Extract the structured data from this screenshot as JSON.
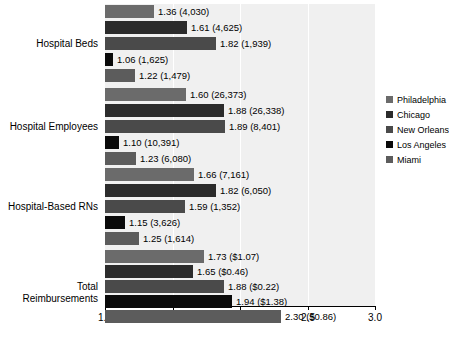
{
  "chart_data": {
    "type": "bar",
    "orientation": "horizontal",
    "title": "",
    "subtitle": "",
    "xlabel": "",
    "ylabel": "",
    "xlim": [
      1.0,
      3.0
    ],
    "xticks": [
      "1.0",
      "1.5",
      "2.0",
      "2.5",
      "3.0"
    ],
    "xtick_values": [
      1.0,
      1.5,
      2.0,
      2.5,
      3.0
    ],
    "gridlines": [
      1.5,
      2.0,
      2.5
    ],
    "grid": true,
    "legend_position": "right",
    "categories": [
      "Hospital Beds",
      "Hospital Employees",
      "Hospital-Based RNs",
      "Total Reimbursements"
    ],
    "series": [
      {
        "name": "Philadelphia",
        "color": "#6b6b6b",
        "values": [
          1.36,
          1.6,
          1.66,
          1.73
        ],
        "labels": [
          "1.36 (4,030)",
          "1.60 (26,373)",
          "1.66 (7,161)",
          "1.73 ($1.07)"
        ]
      },
      {
        "name": "Chicago",
        "color": "#2b2b2b",
        "values": [
          1.61,
          1.88,
          1.82,
          1.65
        ],
        "labels": [
          "1.61 (4,625)",
          "1.88 (26,338)",
          "1.82 (6,050)",
          "1.65 ($0.46)"
        ]
      },
      {
        "name": "New Orleans",
        "color": "#4a4a4a",
        "values": [
          1.82,
          1.89,
          1.59,
          1.88
        ],
        "labels": [
          "1.82 (1,939)",
          "1.89 (8,401)",
          "1.59 (1,352)",
          "1.88 ($0.22)"
        ]
      },
      {
        "name": "Los Angeles",
        "color": "#0a0a0a",
        "values": [
          1.06,
          1.1,
          1.15,
          1.94
        ],
        "labels": [
          "1.06 (1,625)",
          "1.10 (10,391)",
          "1.15 (3,626)",
          "1.94 ($1.38)"
        ]
      },
      {
        "name": "Miami",
        "color": "#5c5c5c",
        "values": [
          1.22,
          1.23,
          1.25,
          2.3
        ],
        "labels": [
          "1.22 (1,479)",
          "1.23 (6,080)",
          "1.25 (1,614)",
          "2.30 ($0.86)"
        ]
      }
    ],
    "plot_background": "#f0f0f0",
    "axis_color": "#000000"
  },
  "legend": {
    "items": [
      {
        "label": "Philadelphia",
        "color": "#6b6b6b"
      },
      {
        "label": "Chicago",
        "color": "#2b2b2b"
      },
      {
        "label": "New Orleans",
        "color": "#4a4a4a"
      },
      {
        "label": "Los Angeles",
        "color": "#0a0a0a"
      },
      {
        "label": "Miami",
        "color": "#5c5c5c"
      }
    ]
  },
  "axis": {
    "ticks": [
      "1.0",
      "1.5",
      "2.0",
      "2.5",
      "3.0"
    ]
  },
  "categories": {
    "c0": "Hospital Beds",
    "c1": "Hospital Employees",
    "c2": "Hospital-Based RNs",
    "c3": "Total Reimbursements"
  }
}
